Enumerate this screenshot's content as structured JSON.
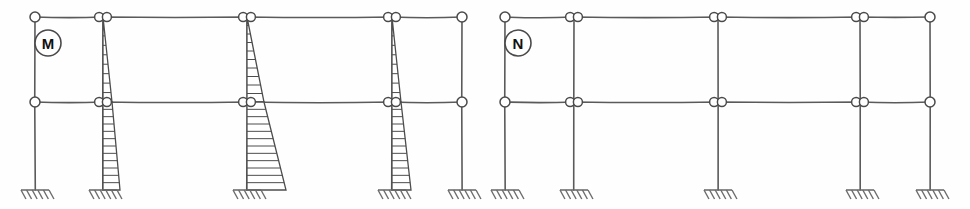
{
  "figure": {
    "background_color": "#fefefe",
    "line_color": "#5a5a5a",
    "node_fill": "#ffffff"
  },
  "panels": [
    {
      "id": "panel-m",
      "label": "M",
      "label_meaning": "bending-moment-diagram",
      "label_circle": {
        "cx": 48,
        "cy": 43,
        "r": 13
      },
      "origin_x": 0,
      "levels": {
        "roof_y": 17,
        "floor_y": 102,
        "base_y": 190
      },
      "columns": [
        {
          "name": "column-1-exterior-left",
          "x": 35,
          "top_node": "single",
          "floor_node": "single",
          "has_moment_diagram": false
        },
        {
          "name": "column-2-interior",
          "x": 103,
          "top_node": "double",
          "floor_node": "double",
          "has_moment_diagram": true
        },
        {
          "name": "column-3-interior-center",
          "x": 247,
          "top_node": "double",
          "floor_node": "double",
          "has_moment_diagram": true
        },
        {
          "name": "column-4-interior",
          "x": 392,
          "top_node": "double",
          "floor_node": "double",
          "has_moment_diagram": true
        },
        {
          "name": "column-5-exterior-right",
          "x": 462,
          "top_node": "single",
          "floor_node": "single",
          "has_moment_diagram": false
        }
      ],
      "moment_diagrams": [
        {
          "name": "moment-column-2",
          "column_x": 103,
          "upper": {
            "top_offset": 0,
            "bottom_offset": 9,
            "hatch_count": 8
          },
          "lower": {
            "top_offset": 9,
            "bottom_offset": 17,
            "hatch_count": 11
          }
        },
        {
          "name": "moment-column-3",
          "column_x": 247,
          "upper": {
            "top_offset": 0,
            "bottom_offset": 17,
            "hatch_count": 9
          },
          "lower": {
            "top_offset": 17,
            "bottom_offset": 39,
            "hatch_count": 11
          }
        },
        {
          "name": "moment-column-4",
          "column_x": 392,
          "upper": {
            "top_offset": 0,
            "bottom_offset": 9,
            "hatch_count": 8
          },
          "lower": {
            "top_offset": 9,
            "bottom_offset": 19,
            "hatch_count": 11
          }
        }
      ],
      "supports": [
        {
          "name": "support-1",
          "x": 35
        },
        {
          "name": "support-2",
          "x": 103
        },
        {
          "name": "support-3",
          "x": 247
        },
        {
          "name": "support-4",
          "x": 392
        },
        {
          "name": "support-5",
          "x": 462
        }
      ]
    },
    {
      "id": "panel-n",
      "label": "N",
      "label_meaning": "axial-force-diagram",
      "label_circle": {
        "cx": 518,
        "cy": 43,
        "r": 13
      },
      "origin_x": 485,
      "levels": {
        "roof_y": 17,
        "floor_y": 102,
        "base_y": 190
      },
      "columns": [
        {
          "name": "column-1-exterior-left",
          "x": 505,
          "top_node": "single",
          "floor_node": "single",
          "has_moment_diagram": false
        },
        {
          "name": "column-2-interior",
          "x": 574,
          "top_node": "double",
          "floor_node": "double",
          "has_moment_diagram": false
        },
        {
          "name": "column-3-interior-center",
          "x": 718,
          "top_node": "double",
          "floor_node": "double",
          "has_moment_diagram": false
        },
        {
          "name": "column-4-interior",
          "x": 860,
          "top_node": "double",
          "floor_node": "double",
          "has_moment_diagram": false
        },
        {
          "name": "column-5-exterior-right",
          "x": 930,
          "top_node": "single",
          "floor_node": "single",
          "has_moment_diagram": false
        }
      ],
      "moment_diagrams": [],
      "supports": [
        {
          "name": "support-1",
          "x": 505
        },
        {
          "name": "support-2",
          "x": 574
        },
        {
          "name": "support-3",
          "x": 718
        },
        {
          "name": "support-4",
          "x": 860
        },
        {
          "name": "support-5",
          "x": 930
        }
      ]
    }
  ],
  "node_radius_single": 5,
  "node_radius_double": 4.5,
  "support": {
    "half_width": 14,
    "hatch_count": 6,
    "hatch_len": 9
  }
}
